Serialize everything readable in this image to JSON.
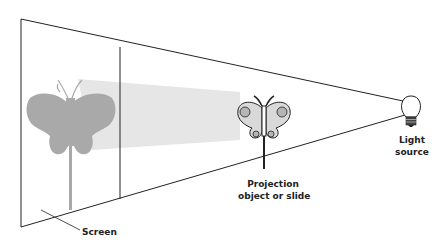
{
  "diagram": {
    "labels": {
      "screen": "Screen",
      "projection_line1": "Projection",
      "projection_line2": "object or slide",
      "light_line1": "Light",
      "light_line2": "source"
    },
    "colors": {
      "outline": "#222222",
      "beam": "#e6e6e6",
      "shadow": "#a9a9a9",
      "object_fill": "#d9d9d9",
      "object_spots": "#b5b5b5"
    },
    "components": [
      "screen",
      "light-beam",
      "shadow-butterfly",
      "projection-object",
      "light-source"
    ]
  }
}
